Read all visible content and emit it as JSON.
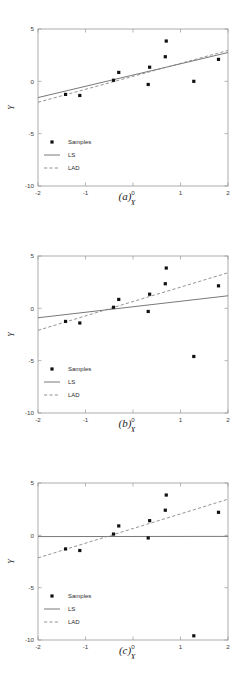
{
  "figure": {
    "panels": [
      {
        "id": "panel-a",
        "caption": "(a)",
        "xlabel": "X",
        "ylabel": "Y"
      },
      {
        "id": "panel-b",
        "caption": "(b)",
        "xlabel": "X",
        "ylabel": "Y"
      },
      {
        "id": "panel-c",
        "caption": "(c)",
        "xlabel": "X",
        "ylabel": "Y"
      }
    ],
    "legend": {
      "samples_label": "Samples",
      "ls_label": "LS",
      "lad_label": "LAD"
    },
    "colors": {
      "samples": "#111111",
      "ls": "#555555",
      "lad": "#888888",
      "frame": "#9a9a9a",
      "background": "#ffffff"
    }
  },
  "chart_data": [
    {
      "type": "scatter",
      "title": "(a)",
      "xlabel": "X",
      "ylabel": "Y",
      "xlim": [
        -2,
        2
      ],
      "ylim": [
        -10,
        5
      ],
      "xticks": [
        -2,
        -1,
        0,
        1,
        2
      ],
      "yticks": [
        -10,
        -5,
        0,
        5
      ],
      "xticklabels": [
        "-2",
        "-1",
        "0",
        "1",
        "2"
      ],
      "yticklabels": [
        "-10",
        "-5",
        "0",
        "5"
      ],
      "grid": false,
      "legend": [
        "Samples",
        "LS",
        "LAD"
      ],
      "legend_position": "lower left",
      "series": [
        {
          "name": "Samples",
          "type": "scatter",
          "points": [
            [
              -1.42,
              -1.25
            ],
            [
              -1.12,
              -1.35
            ],
            [
              -0.41,
              0.1
            ],
            [
              -0.3,
              0.85
            ],
            [
              0.32,
              -0.3
            ],
            [
              0.35,
              1.35
            ],
            [
              0.68,
              2.35
            ],
            [
              0.7,
              3.85
            ],
            [
              1.28,
              0.0
            ],
            [
              1.8,
              2.1
            ]
          ]
        },
        {
          "name": "LS",
          "type": "line",
          "endpoints": [
            [
              -2,
              -1.55
            ],
            [
              2,
              2.75
            ]
          ]
        },
        {
          "name": "LAD",
          "type": "line",
          "endpoints": [
            [
              -2,
              -2.0
            ],
            [
              2,
              2.95
            ]
          ]
        }
      ]
    },
    {
      "type": "scatter",
      "title": "(b)",
      "xlabel": "X",
      "ylabel": "Y",
      "xlim": [
        -2,
        2
      ],
      "ylim": [
        -10,
        5
      ],
      "xticks": [
        -2,
        -1,
        0,
        1,
        2
      ],
      "yticks": [
        -10,
        -5,
        0,
        5
      ],
      "xticklabels": [
        "-2",
        "-1",
        "0",
        "1",
        "2"
      ],
      "yticklabels": [
        "-10",
        "-5",
        "0",
        "5"
      ],
      "grid": false,
      "legend": [
        "Samples",
        "LS",
        "LAD"
      ],
      "legend_position": "lower left",
      "series": [
        {
          "name": "Samples",
          "type": "scatter",
          "points": [
            [
              -1.42,
              -1.25
            ],
            [
              -1.12,
              -1.4
            ],
            [
              -0.41,
              0.1
            ],
            [
              -0.3,
              0.85
            ],
            [
              0.32,
              -0.3
            ],
            [
              0.35,
              1.35
            ],
            [
              0.68,
              2.35
            ],
            [
              0.7,
              3.85
            ],
            [
              1.28,
              -4.6
            ],
            [
              1.8,
              2.15
            ]
          ]
        },
        {
          "name": "LS",
          "type": "line",
          "endpoints": [
            [
              -2,
              -0.9
            ],
            [
              2,
              1.2
            ]
          ]
        },
        {
          "name": "LAD",
          "type": "line",
          "endpoints": [
            [
              -2,
              -2.1
            ],
            [
              2,
              3.4
            ]
          ]
        }
      ]
    },
    {
      "type": "scatter",
      "title": "(c)",
      "xlabel": "X",
      "ylabel": "Y",
      "xlim": [
        -2,
        2
      ],
      "ylim": [
        -10,
        5
      ],
      "xticks": [
        -2,
        -1,
        0,
        1,
        2
      ],
      "yticks": [
        -10,
        -5,
        0,
        5
      ],
      "xticklabels": [
        "-2",
        "-1",
        "0",
        "1",
        "2"
      ],
      "yticklabels": [
        "-10",
        "-5",
        "0",
        "5"
      ],
      "grid": false,
      "legend": [
        "Samples",
        "LS",
        "LAD"
      ],
      "legend_position": "lower left",
      "series": [
        {
          "name": "Samples",
          "type": "scatter",
          "points": [
            [
              -1.42,
              -1.3
            ],
            [
              -1.12,
              -1.45
            ],
            [
              -0.41,
              0.12
            ],
            [
              -0.3,
              0.9
            ],
            [
              0.32,
              -0.25
            ],
            [
              0.35,
              1.4
            ],
            [
              0.68,
              2.4
            ],
            [
              0.7,
              3.85
            ],
            [
              1.28,
              -9.6
            ],
            [
              1.8,
              2.2
            ]
          ]
        },
        {
          "name": "LS",
          "type": "line",
          "endpoints": [
            [
              -2,
              -0.12
            ],
            [
              2,
              -0.1
            ]
          ]
        },
        {
          "name": "LAD",
          "type": "line",
          "endpoints": [
            [
              -2,
              -2.15
            ],
            [
              2,
              3.45
            ]
          ]
        }
      ]
    }
  ]
}
